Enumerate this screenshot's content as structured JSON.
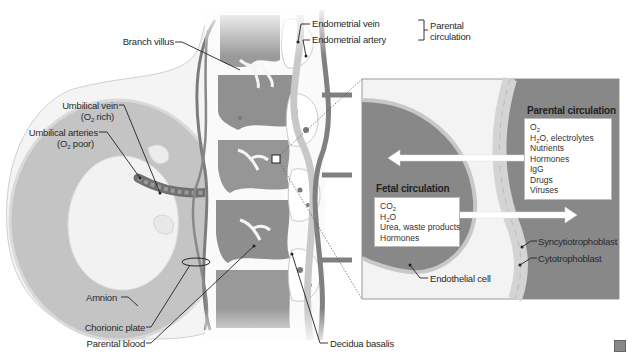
{
  "figure": {
    "colors": {
      "dark_tissue": "#8a8a8a",
      "mid_tissue": "#b5b5b5",
      "light_tissue": "#e3e3e3",
      "background": "#ffffff",
      "arrow": "#ffffff",
      "leader_line": "#222222"
    }
  },
  "labels": {
    "branch_villus": "Branch villus",
    "endometrial_vein": "Endometrial vein",
    "endometrial_artery": "Endometrial artery",
    "parental_circulation_bracket": "Parental circulation",
    "umbilical_vein": "Umbilical vein",
    "umbilical_vein_note": "(O2 rich)",
    "umbilical_arteries": "Umbilical arteries",
    "umbilical_arteries_note": "(O2 poor)",
    "amnion": "Amnion",
    "chorionic_plate": "Chorionic plate",
    "parental_blood": "Parental blood",
    "decidua_basalis": "Decidua basalis"
  },
  "inset": {
    "parental_title": "Parental circulation",
    "parental_items": [
      "O2",
      "H2O, electrolytes",
      "Nutrients",
      "Hormones",
      "IgG",
      "Drugs",
      "Viruses"
    ],
    "fetal_title": "Fetal circulation",
    "fetal_items": [
      "CO2",
      "H2O",
      "Urea, waste products",
      "Hormones"
    ],
    "syncytiotrophoblast": "Syncytiotrophoblast",
    "cytotrophoblast": "Cytotrophoblast",
    "endothelial_cell": "Endothelial cell"
  }
}
